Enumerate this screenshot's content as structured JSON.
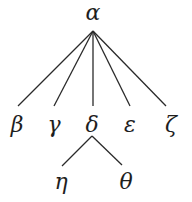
{
  "diagram": {
    "type": "tree",
    "root": "alpha",
    "nodes": [
      {
        "id": "alpha",
        "label": "α",
        "x": 93,
        "y": 20,
        "anchor": {
          "x": 93,
          "y": 31
        }
      },
      {
        "id": "beta",
        "label": "β",
        "x": 17,
        "y": 132,
        "anchor": {
          "x": 18,
          "y": 106
        }
      },
      {
        "id": "gamma",
        "label": "γ",
        "x": 54,
        "y": 132,
        "anchor": {
          "x": 54,
          "y": 106
        }
      },
      {
        "id": "delta",
        "label": "δ",
        "x": 92,
        "y": 132,
        "anchor": {
          "x": 93,
          "y": 106
        }
      },
      {
        "id": "epsilon",
        "label": "ε",
        "x": 130,
        "y": 132,
        "anchor": {
          "x": 130,
          "y": 106
        }
      },
      {
        "id": "zeta",
        "label": "ζ",
        "x": 171,
        "y": 132,
        "anchor": {
          "x": 166,
          "y": 106
        }
      },
      {
        "id": "eta",
        "label": "η",
        "x": 61,
        "y": 189,
        "anchor": {
          "x": 62,
          "y": 166
        }
      },
      {
        "id": "theta",
        "label": "θ",
        "x": 126,
        "y": 189,
        "anchor": {
          "x": 122,
          "y": 166
        }
      }
    ],
    "edges": [
      {
        "from": "alpha",
        "to": "beta",
        "x1": 93,
        "y1": 31,
        "x2": 18,
        "y2": 106
      },
      {
        "from": "alpha",
        "to": "gamma",
        "x1": 93,
        "y1": 31,
        "x2": 54,
        "y2": 106
      },
      {
        "from": "alpha",
        "to": "delta",
        "x1": 93,
        "y1": 31,
        "x2": 93,
        "y2": 106
      },
      {
        "from": "alpha",
        "to": "epsilon",
        "x1": 93,
        "y1": 31,
        "x2": 130,
        "y2": 106
      },
      {
        "from": "alpha",
        "to": "zeta",
        "x1": 93,
        "y1": 31,
        "x2": 166,
        "y2": 106
      },
      {
        "from": "delta",
        "to": "eta",
        "x1": 92,
        "y1": 136,
        "x2": 62,
        "y2": 166
      },
      {
        "from": "delta",
        "to": "theta",
        "x1": 92,
        "y1": 136,
        "x2": 122,
        "y2": 165
      }
    ],
    "colors": {
      "edge": "#2a2a2a",
      "label": "#1e1e1e",
      "background": "#ffffff"
    }
  }
}
